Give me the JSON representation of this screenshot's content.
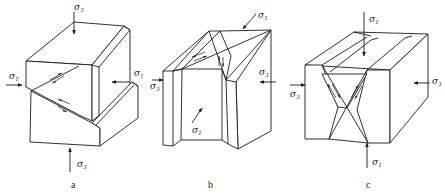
{
  "figure": {
    "panels": [
      {
        "id": "a",
        "caption": "a",
        "description": "Normal fault block: vertical sigma3 (top/bottom), horizontal sigma1 (left/right)",
        "labels": {
          "top": {
            "sym": "σ",
            "sub": "3"
          },
          "left": {
            "sym": "σ",
            "sub": "1"
          },
          "right": {
            "sym": "σ",
            "sub": "1"
          },
          "bottom": {
            "sym": "σ",
            "sub": "3"
          }
        }
      },
      {
        "id": "b",
        "caption": "b",
        "description": "Strike-slip fault block: horizontal sigma1 (back/front), sigma3 (left/right)",
        "labels": {
          "top": {
            "sym": "σ",
            "sub": "1"
          },
          "left": {
            "sym": "σ",
            "sub": "3"
          },
          "right": {
            "sym": "σ",
            "sub": "3"
          },
          "front": {
            "sym": "σ",
            "sub": "1"
          }
        }
      },
      {
        "id": "c",
        "caption": "c",
        "description": "Conjugate faults: vertical sigma1 (top/bottom), horizontal sigma3 (left/right)",
        "labels": {
          "top": {
            "sym": "σ",
            "sub": "1"
          },
          "left": {
            "sym": "σ",
            "sub": "3"
          },
          "right": {
            "sym": "σ",
            "sub": "3"
          },
          "bottom": {
            "sym": "σ",
            "sub": "1"
          }
        }
      }
    ],
    "colors": {
      "line": "#1a1a1a",
      "background": "#ffffff"
    }
  }
}
